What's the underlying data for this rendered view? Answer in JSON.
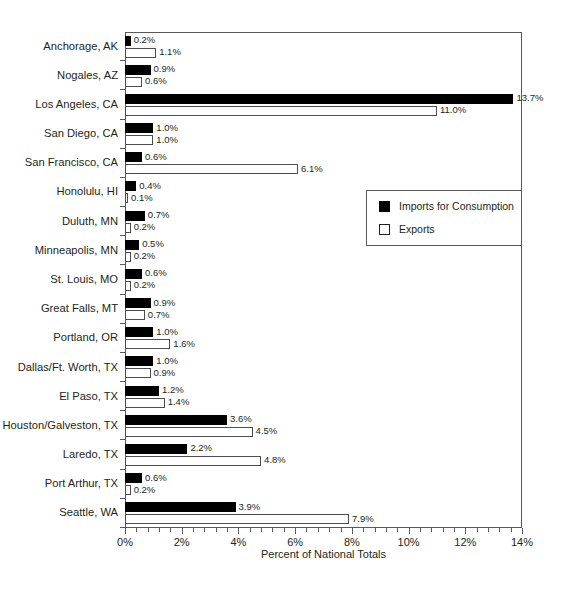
{
  "chart_data": {
    "type": "bar",
    "orientation": "horizontal",
    "title": "",
    "xlabel": "Percent of National Totals",
    "ylabel": "",
    "xlim": [
      0,
      14
    ],
    "xticks": [
      0,
      2,
      4,
      6,
      8,
      10,
      12,
      14
    ],
    "xticklabels": [
      "0%",
      "2%",
      "4%",
      "6%",
      "8%",
      "10%",
      "12%",
      "14%"
    ],
    "minor_tick_step": 0.4,
    "grid": false,
    "legend_position": "middle-right",
    "categories": [
      "Anchorage, AK",
      "Nogales, AZ",
      "Los Angeles, CA",
      "San Diego, CA",
      "San Francisco, CA",
      "Honolulu, HI",
      "Duluth, MN",
      "Minneapolis, MN",
      "St. Louis, MO",
      "Great Falls, MT",
      "Portland, OR",
      "Dallas/Ft. Worth, TX",
      "El Paso, TX",
      "Houston/Galveston, TX",
      "Laredo, TX",
      "Port Arthur, TX",
      "Seattle, WA"
    ],
    "series": [
      {
        "name": "Imports for Consumption",
        "color": "#000000",
        "style": "filled",
        "values": [
          0.2,
          0.9,
          13.7,
          1.0,
          0.6,
          0.4,
          0.7,
          0.5,
          0.6,
          0.9,
          1.0,
          1.0,
          1.2,
          3.6,
          2.2,
          0.6,
          3.9
        ],
        "labels": [
          "0.2%",
          "0.9%",
          "13.7%",
          "1.0%",
          "0.6%",
          "0.4%",
          "0.7%",
          "0.5%",
          "0.6%",
          "0.9%",
          "1.0%",
          "1.0%",
          "1.2%",
          "3.6%",
          "2.2%",
          "0.6%",
          "3.9%"
        ]
      },
      {
        "name": "Exports",
        "color": "#ffffff",
        "style": "hollow",
        "values": [
          1.1,
          0.6,
          11.0,
          1.0,
          6.1,
          0.1,
          0.2,
          0.2,
          0.2,
          0.7,
          1.6,
          0.9,
          1.4,
          4.5,
          4.8,
          0.2,
          7.9
        ],
        "labels": [
          "1.1%",
          "0.6%",
          "11.0%",
          "1.0%",
          "6.1%",
          "0.1%",
          "0.2%",
          "0.2%",
          "0.2%",
          "0.7%",
          "1.6%",
          "0.9%",
          "1.4%",
          "4.5%",
          "4.8%",
          "0.2%",
          "7.9%"
        ]
      }
    ]
  },
  "legend": {
    "entries": [
      {
        "label": "Imports for Consumption",
        "swatch": "filled"
      },
      {
        "label": "Exports",
        "swatch": "hollow"
      }
    ]
  }
}
